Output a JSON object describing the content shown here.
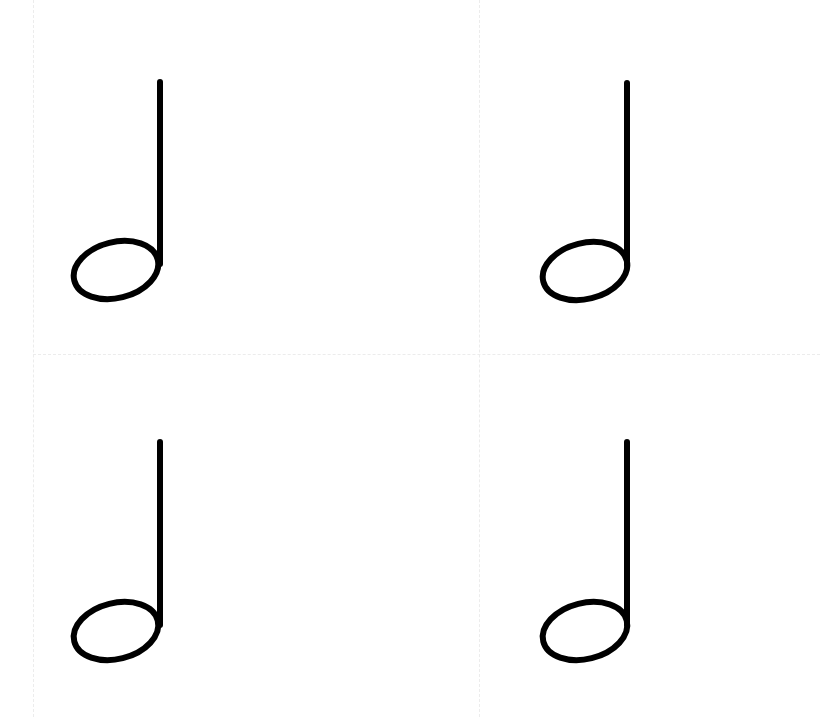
{
  "page": {
    "background": "#ffffff",
    "ink_color": "#000000",
    "guide_color": "#ececec"
  },
  "guides": {
    "vertical_x": [
      33,
      479
    ],
    "horizontal_y": [
      354
    ]
  },
  "notes": [
    {
      "symbol": "half-note",
      "stem_x": 160,
      "stem_top": 82,
      "head_cx": 116,
      "head_cy": 270
    },
    {
      "symbol": "half-note",
      "stem_x": 627,
      "stem_top": 83,
      "head_cx": 585,
      "head_cy": 271
    },
    {
      "symbol": "half-note",
      "stem_x": 160,
      "stem_top": 442,
      "head_cx": 116,
      "head_cy": 631
    },
    {
      "symbol": "half-note",
      "stem_x": 627,
      "stem_top": 442,
      "head_cx": 585,
      "head_cy": 631
    }
  ]
}
